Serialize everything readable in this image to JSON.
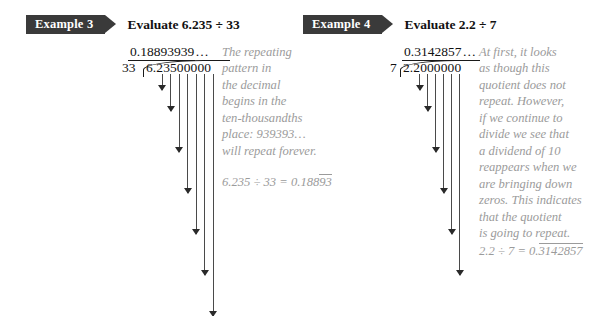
{
  "examples": [
    {
      "banner_label": "Example 3",
      "title": "Evaluate 6.235 ÷ 33",
      "quotient": "0.18893939",
      "quotient_trailing": "…",
      "divisor": "33",
      "dividend": "6.23500000",
      "steps": [
        {
          "text": "−3 3",
          "underline": true,
          "bold": false,
          "indent": 0
        },
        {
          "text": "293",
          "underline": false,
          "bold": false,
          "indent": 0
        },
        {
          "text": "−264",
          "underline": true,
          "bold": false,
          "indent": 1
        },
        {
          "text": "295",
          "underline": false,
          "bold": false,
          "indent": 1
        },
        {
          "text": "−264",
          "underline": true,
          "bold": false,
          "indent": 2
        },
        {
          "text": "310",
          "underline": false,
          "bold": false,
          "indent": 2
        },
        {
          "text": "−297",
          "underline": true,
          "bold": false,
          "indent": 3
        },
        {
          "text": "130",
          "underline": false,
          "bold": true,
          "indent": 3
        },
        {
          "text": "−99",
          "underline": true,
          "bold": false,
          "indent": 4
        },
        {
          "text": "310",
          "underline": false,
          "bold": false,
          "indent": 4
        },
        {
          "text": "−297",
          "underline": true,
          "bold": false,
          "indent": 5
        },
        {
          "text": "130",
          "underline": false,
          "bold": true,
          "indent": 5
        },
        {
          "text": "−99",
          "underline": true,
          "bold": false,
          "indent": 6
        },
        {
          "text": "310…",
          "underline": false,
          "bold": false,
          "indent": 6
        }
      ],
      "note_lines": [
        "The repeating",
        "pattern in",
        "the decimal",
        "begins in the",
        "ten-thousandths",
        "place: 939393…",
        "will repeat forever."
      ],
      "result_prefix": "6.235 ÷ 33 = 0.188",
      "result_repeat": "93"
    },
    {
      "banner_label": "Example 4",
      "title": "Evaluate 2.2 ÷ 7",
      "quotient": "0.3142857",
      "quotient_trailing": "…",
      "divisor": "7",
      "dividend": "2.2000000",
      "steps": [
        {
          "text": "−2 1",
          "underline": true,
          "bold": false,
          "indent": 0
        },
        {
          "text": "10",
          "underline": false,
          "bold": true,
          "indent": 0
        },
        {
          "text": "−7",
          "underline": true,
          "bold": false,
          "indent": 1
        },
        {
          "text": "30",
          "underline": false,
          "bold": false,
          "indent": 1
        },
        {
          "text": "−28",
          "underline": true,
          "bold": false,
          "indent": 2
        },
        {
          "text": "20",
          "underline": false,
          "bold": false,
          "indent": 2
        },
        {
          "text": "−14",
          "underline": true,
          "bold": false,
          "indent": 3
        },
        {
          "text": "60",
          "underline": false,
          "bold": false,
          "indent": 3
        },
        {
          "text": "−56",
          "underline": true,
          "bold": false,
          "indent": 4
        },
        {
          "text": "40",
          "underline": false,
          "bold": false,
          "indent": 4
        },
        {
          "text": "−35",
          "underline": true,
          "bold": false,
          "indent": 5
        },
        {
          "text": "50",
          "underline": false,
          "bold": false,
          "indent": 5
        },
        {
          "text": "−49",
          "underline": true,
          "bold": false,
          "indent": 6
        },
        {
          "text": "10 …",
          "underline": false,
          "bold": true,
          "indent": 6
        }
      ],
      "note_lines": [
        "At first, it looks",
        "as though this",
        "quotient does not",
        "repeat. However,",
        "if we continue to",
        "divide we see that",
        "a dividend of 10",
        "reappears when we",
        "are bringing down",
        "zeros. This indicates",
        "that the quotient",
        "is going to repeat."
      ],
      "result_prefix": "2.2 ÷ 7 = 0.",
      "result_repeat": "3142857"
    }
  ],
  "colors": {
    "banner_bg": "#3a3a3a",
    "banner_text": "#ffffff",
    "ink": "#111111",
    "note_text": "#9b9b9b",
    "arrow": "#2a2a2a"
  }
}
